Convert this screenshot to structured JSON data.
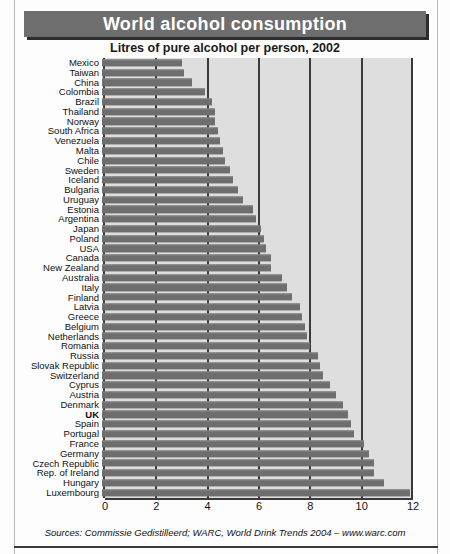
{
  "header": {
    "title": "World alcohol consumption",
    "subtitle": "Litres of pure alcohol per person, 2002"
  },
  "source": "Sources: Commissie Gedistilleerd; WARC, World Drink Trends 2004 – www.warc.com",
  "colors": {
    "title_bar": "#6e6e6e",
    "title_text": "#ffffff",
    "plot_background": "#dedede",
    "bar": "#6e6e6e",
    "axis": "#3a3a3a"
  },
  "chart_data": {
    "type": "bar",
    "orientation": "horizontal",
    "title": "World alcohol consumption",
    "subtitle": "Litres of pure alcohol per person, 2002",
    "xlabel": "",
    "ylabel": "",
    "xlim": [
      0,
      12
    ],
    "xticks": [
      0,
      2,
      4,
      6,
      8,
      10,
      12
    ],
    "grid": true,
    "legend": false,
    "highlight": "UK",
    "categories": [
      "Mexico",
      "Taiwan",
      "China",
      "Colombia",
      "Brazil",
      "Thailand",
      "Norway",
      "South Africa",
      "Venezuela",
      "Malta",
      "Chile",
      "Sweden",
      "Iceland",
      "Bulgaria",
      "Uruguay",
      "Estonia",
      "Argentina",
      "Japan",
      "Poland",
      "USA",
      "Canada",
      "New Zealand",
      "Australia",
      "Italy",
      "Finland",
      "Latvia",
      "Greece",
      "Belgium",
      "Netherlands",
      "Romania",
      "Russia",
      "Slovak Republic",
      "Switzerland",
      "Cyprus",
      "Austria",
      "Denmark",
      "UK",
      "Spain",
      "Portugal",
      "France",
      "Germany",
      "Czech Republic",
      "Rep. of Ireland",
      "Hungary",
      "Luxembourg"
    ],
    "values": [
      3.1,
      3.2,
      3.5,
      4.0,
      4.3,
      4.4,
      4.4,
      4.5,
      4.6,
      4.7,
      4.8,
      5.0,
      5.1,
      5.3,
      5.5,
      5.9,
      6.0,
      6.2,
      6.3,
      6.4,
      6.6,
      6.6,
      7.0,
      7.2,
      7.4,
      7.7,
      7.8,
      7.9,
      8.0,
      8.1,
      8.4,
      8.5,
      8.6,
      8.9,
      9.1,
      9.4,
      9.6,
      9.7,
      9.8,
      10.2,
      10.4,
      10.6,
      10.6,
      11.0,
      12.0
    ]
  }
}
